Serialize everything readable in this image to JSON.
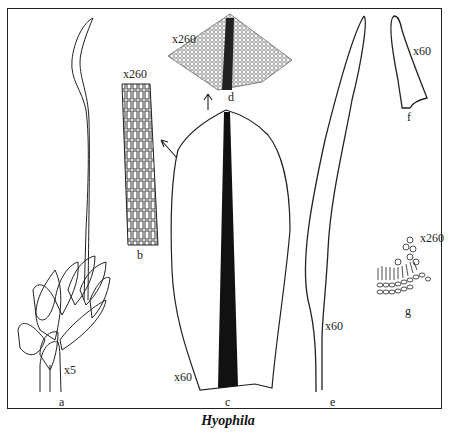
{
  "plate": {
    "title": "Hyophila",
    "figures": [
      {
        "id": "a",
        "label": "a",
        "magnification": "x5",
        "description": "whole plant with leafy stem and capsule seta"
      },
      {
        "id": "b",
        "label": "b",
        "magnification": "x260",
        "description": "leaf cells"
      },
      {
        "id": "c",
        "label": "c",
        "magnification": "x60",
        "description": "leaf with dark costa"
      },
      {
        "id": "d",
        "label": "d",
        "magnification": "x260",
        "description": "leaf apex cells"
      },
      {
        "id": "e",
        "label": "e",
        "magnification": "x60",
        "description": "capsule"
      },
      {
        "id": "f",
        "label": "f",
        "magnification": "x60",
        "description": "operculum"
      },
      {
        "id": "g",
        "label": "g",
        "magnification": "x260",
        "description": "leaf cross-section"
      }
    ]
  },
  "colors": {
    "ink": "#222222",
    "background": "#ffffff"
  }
}
